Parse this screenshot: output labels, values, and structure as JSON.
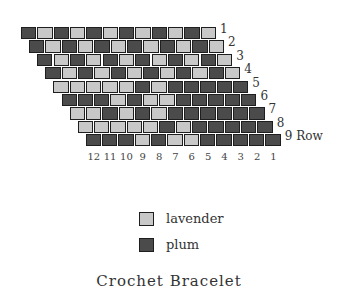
{
  "colors": {
    "L": "#c8c8c8",
    "D": "#4b4b4b"
  },
  "rows": [
    {
      "label": "1",
      "cells": [
        "D",
        "L",
        "D",
        "L",
        "D",
        "L",
        "D",
        "L",
        "D",
        "L",
        "D",
        "L"
      ]
    },
    {
      "label": "2",
      "cells": [
        "D",
        "L",
        "D",
        "L",
        "D",
        "L",
        "D",
        "L",
        "D",
        "L",
        "D",
        "L"
      ]
    },
    {
      "label": "3",
      "cells": [
        "D",
        "L",
        "D",
        "L",
        "D",
        "L",
        "D",
        "L",
        "D",
        "L",
        "D",
        "L"
      ]
    },
    {
      "label": "4",
      "cells": [
        "D",
        "L",
        "D",
        "L",
        "D",
        "L",
        "D",
        "L",
        "D",
        "L",
        "D",
        "L"
      ]
    },
    {
      "label": "5",
      "cells": [
        "L",
        "L",
        "L",
        "L",
        "L",
        "D",
        "L",
        "D",
        "D",
        "D",
        "D",
        "D"
      ]
    },
    {
      "label": "6",
      "cells": [
        "D",
        "D",
        "D",
        "L",
        "D",
        "L",
        "L",
        "D",
        "D",
        "D",
        "D",
        "D"
      ]
    },
    {
      "label": "7",
      "cells": [
        "L",
        "L",
        "D",
        "L",
        "D",
        "L",
        "D",
        "D",
        "D",
        "D",
        "D",
        "D"
      ]
    },
    {
      "label": "8",
      "cells": [
        "L",
        "L",
        "L",
        "L",
        "L",
        "D",
        "L",
        "D",
        "D",
        "D",
        "D",
        "D"
      ]
    },
    {
      "label": "9",
      "cells": [
        "D",
        "D",
        "D",
        "L",
        "D",
        "L",
        "L",
        "D",
        "D",
        "D",
        "D",
        "D"
      ]
    }
  ],
  "row_axis_label": "Row",
  "column_labels": [
    "12",
    "11",
    "10",
    "9",
    "8",
    "7",
    "6",
    "5",
    "4",
    "3",
    "2",
    "1"
  ],
  "legend": [
    {
      "key": "L",
      "label": "lavender"
    },
    {
      "key": "D",
      "label": "plum"
    }
  ],
  "title": "Crochet Bracelet"
}
